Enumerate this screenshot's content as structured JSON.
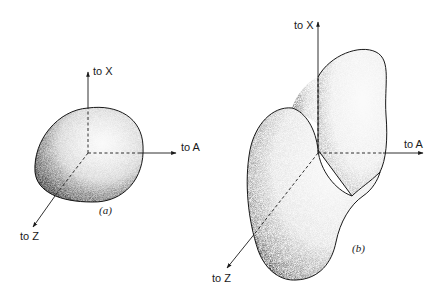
{
  "figure": {
    "panels": [
      {
        "id": "a",
        "caption": "(a)",
        "shape": "ellipsoid",
        "axes": {
          "x_label": "to X",
          "a_label": "to A",
          "z_label": "to Z"
        }
      },
      {
        "id": "b",
        "caption": "(b)",
        "shape": "peanut-shaped surface (two lobes)",
        "axes": {
          "x_label": "to X",
          "a_label": "to A",
          "z_label": "to Z"
        }
      }
    ],
    "colors": {
      "line": "#1a1a1a",
      "shade_dark": "#222222",
      "fill_light": "#f4f4f4"
    }
  }
}
